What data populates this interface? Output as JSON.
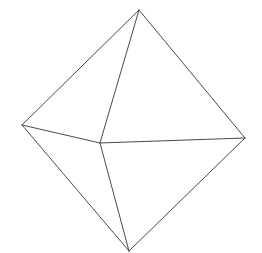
{
  "diagram": {
    "type": "octahedron-wireframe",
    "background": "#ffffff",
    "stroke_color": "#4a4a4a",
    "vertices": {
      "top": [
        139,
        10
      ],
      "left": [
        22,
        125
      ],
      "right": [
        245,
        138
      ],
      "bottom": [
        129,
        251
      ],
      "front": [
        100,
        143
      ]
    },
    "edges": [
      [
        "top",
        "left"
      ],
      [
        "top",
        "right"
      ],
      [
        "top",
        "front"
      ],
      [
        "left",
        "front"
      ],
      [
        "front",
        "right"
      ],
      [
        "left",
        "bottom"
      ],
      [
        "right",
        "bottom"
      ],
      [
        "front",
        "bottom"
      ]
    ]
  }
}
